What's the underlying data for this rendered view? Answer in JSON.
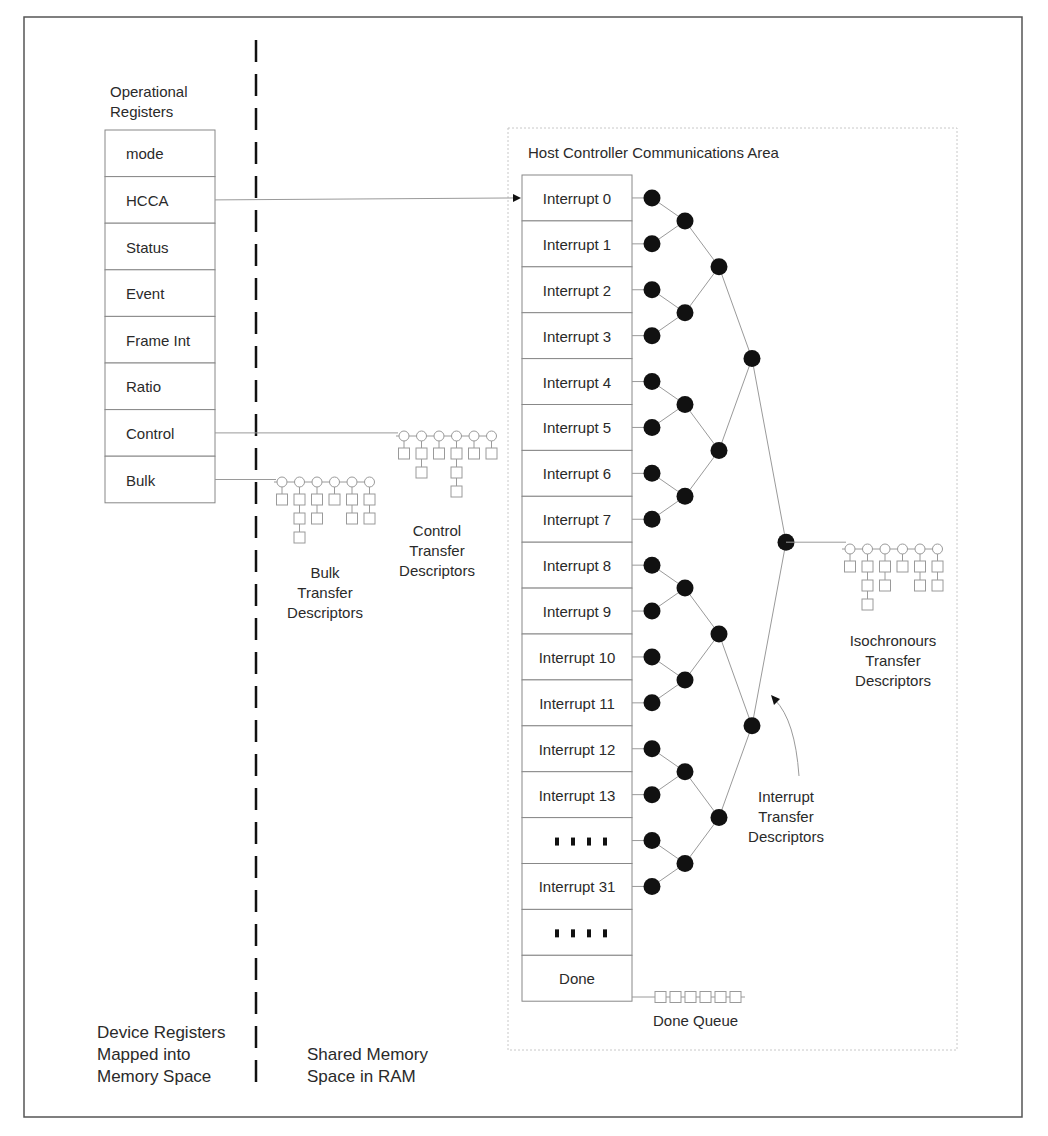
{
  "diagram": {
    "type": "memory-map",
    "frame": {
      "x": 24,
      "y": 17,
      "w": 998,
      "h": 1100
    },
    "divider": {
      "x": 256,
      "y1": 40,
      "y2": 1092
    },
    "operational_registers": {
      "title_lines": [
        "Operational",
        "Registers"
      ],
      "box": {
        "x": 105,
        "y": 130,
        "w": 110,
        "row_h": 46.6
      },
      "rows": [
        "mode",
        "HCCA",
        "Status",
        "Event",
        "Frame Int",
        "Ratio",
        "Control",
        "Bulk"
      ]
    },
    "hcca_area": {
      "title": "Host Controller Communications Area",
      "area": {
        "x": 508,
        "y": 128,
        "w": 449,
        "h": 922
      },
      "box": {
        "x": 522,
        "y": 175,
        "w": 110,
        "row_h": 45.9
      },
      "rows": [
        "Interrupt 0",
        "Interrupt 1",
        "Interrupt 2",
        "Interrupt 3",
        "Interrupt 4",
        "Interrupt 5",
        "Interrupt 6",
        "Interrupt 7",
        "Interrupt 8",
        "Interrupt 9",
        "Interrupt 10",
        "Interrupt 11",
        "Interrupt 12",
        "Interrupt 13",
        "....",
        "Interrupt 31",
        "....",
        "Done"
      ],
      "tree_levels_x": [
        652,
        685,
        719,
        752,
        786
      ]
    },
    "descriptor_groups": [
      {
        "name": "Bulk Transfer Descriptors",
        "label_lines": [
          "Bulk",
          "Transfer",
          "Descriptors"
        ],
        "start_x": 282,
        "y": 482,
        "columns": [
          1,
          3,
          2,
          1,
          2,
          2
        ],
        "label_x": 325,
        "label_y": 578
      },
      {
        "name": "Control Transfer Descriptors",
        "label_lines": [
          "Control",
          "Transfer",
          "Descriptors"
        ],
        "start_x": 404,
        "y": 436,
        "columns": [
          1,
          2,
          1,
          3,
          1,
          1
        ],
        "label_x": 437,
        "label_y": 536
      },
      {
        "name": "Isochronous Transfer Descriptors",
        "label_lines": [
          "Isochronours",
          "Transfer",
          "Descriptors"
        ],
        "start_x": 850,
        "y": 549,
        "columns": [
          1,
          3,
          2,
          1,
          2,
          2
        ],
        "label_x": 893,
        "label_y": 646
      }
    ],
    "done_queue": {
      "label": "Done Queue",
      "count": 6,
      "x": 655,
      "y": 997
    },
    "interrupt_label": {
      "lines": [
        "Interrupt",
        "Transfer",
        "Descriptors"
      ],
      "x": 786,
      "y": 802
    },
    "footer": {
      "left_lines": [
        "Device Registers",
        "Mapped into",
        "Memory Space"
      ],
      "right_lines": [
        "Shared Memory",
        "Space in RAM"
      ]
    },
    "colors": {
      "frame": "#555555",
      "line": "#9a9a9a",
      "node": "#111111",
      "text": "#2a2a2a",
      "dotted": "#c8c8c8"
    }
  }
}
